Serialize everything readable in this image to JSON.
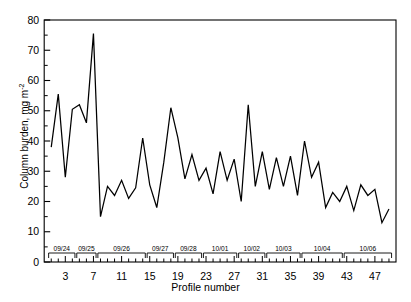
{
  "chart_data": {
    "type": "line",
    "title": "",
    "xlabel": "Profile number",
    "ylabel_text": "Column burden, mg  m",
    "ylabel_exponent": "-2",
    "ylabel_full": "Column burden, mg  m-2",
    "xlim": [
      0,
      50
    ],
    "ylim": [
      0,
      80
    ],
    "ytick_values": [
      0,
      10,
      20,
      30,
      40,
      50,
      60,
      70,
      80
    ],
    "ytick_labels": [
      "0",
      "10",
      "20",
      "30",
      "40",
      "50",
      "60",
      "70",
      "80"
    ],
    "yminor_step": 5,
    "xtick_labeled_values": [
      3,
      7,
      11,
      15,
      19,
      23,
      27,
      31,
      35,
      39,
      43,
      47
    ],
    "xtick_labels": [
      "3",
      "7",
      "11",
      "15",
      "19",
      "23",
      "27",
      "31",
      "35",
      "39",
      "43",
      "47"
    ],
    "xtick_step": 1,
    "grid": false,
    "legend": false,
    "line_color": "#000000",
    "frame_color": "#000000",
    "x": [
      1,
      2,
      3,
      4,
      5,
      6,
      7,
      8,
      9,
      10,
      11,
      12,
      13,
      14,
      15,
      16,
      17,
      18,
      19,
      20,
      21,
      22,
      23,
      24,
      25,
      26,
      27,
      28,
      29,
      30,
      31,
      32,
      33,
      34,
      35,
      36,
      37,
      38,
      39,
      40,
      41,
      42,
      43,
      44,
      45,
      46,
      47,
      48,
      49
    ],
    "values": [
      38,
      55.5,
      28,
      50.5,
      52,
      46,
      75.5,
      15,
      25,
      22,
      27,
      21,
      24.5,
      41,
      25.5,
      18,
      33,
      51,
      41,
      27.5,
      35.5,
      27,
      31,
      22.5,
      36.5,
      27,
      34,
      20,
      52,
      25,
      36.5,
      24,
      34.5,
      25,
      35,
      22,
      40,
      28,
      33,
      18,
      23,
      20,
      25,
      17,
      25.5,
      22,
      24,
      13,
      17.5
    ],
    "series_name": "Column burden",
    "date_brackets": [
      {
        "label": "09/24",
        "start": 1,
        "end": 4
      },
      {
        "label": "09/25",
        "start": 5,
        "end": 7
      },
      {
        "label": "09/26",
        "start": 8,
        "end": 14
      },
      {
        "label": "09/27",
        "start": 15,
        "end": 18
      },
      {
        "label": "09/28",
        "start": 19,
        "end": 22
      },
      {
        "label": "10/01",
        "start": 23,
        "end": 27
      },
      {
        "label": "10/02",
        "start": 28,
        "end": 31
      },
      {
        "label": "10/03",
        "start": 32,
        "end": 36
      },
      {
        "label": "10/04",
        "start": 37,
        "end": 42
      },
      {
        "label": "10/06",
        "start": 43,
        "end": 49
      }
    ]
  }
}
